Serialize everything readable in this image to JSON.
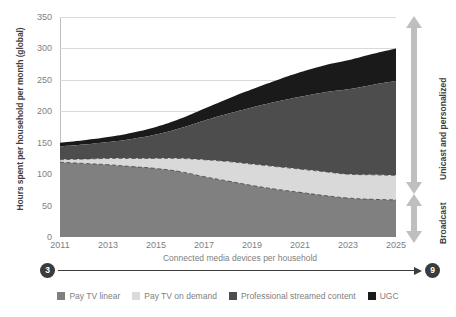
{
  "chart_data": {
    "type": "area",
    "title": "",
    "subtitle": "",
    "xlabel": "",
    "ylabel": "Hours spent per household per month (global)",
    "ylim": [
      0,
      350
    ],
    "ytick_values": [
      0,
      50,
      100,
      150,
      200,
      250,
      300,
      350
    ],
    "ytick_labels": [
      "0",
      "50",
      "100",
      "150",
      "200",
      "250",
      "300",
      "350"
    ],
    "xlim": [
      2011,
      2025
    ],
    "x": [
      2011,
      2012,
      2013,
      2014,
      2015,
      2016,
      2017,
      2018,
      2019,
      2020,
      2021,
      2022,
      2023,
      2024,
      2025
    ],
    "xtick_values": [
      2011,
      2013,
      2015,
      2017,
      2019,
      2021,
      2023,
      2025
    ],
    "xtick_labels": [
      "2011",
      "2013",
      "2015",
      "2017",
      "2019",
      "2021",
      "2023",
      "2025"
    ],
    "grid": true,
    "stacked": true,
    "legend_position": "bottom",
    "series": [
      {
        "name": "Pay TV linear",
        "color": "#808080",
        "values": [
          119,
          117,
          115,
          112,
          109,
          104,
          96,
          89,
          82,
          76,
          71,
          66,
          62,
          60,
          59
        ]
      },
      {
        "name": "Pay TV on demand",
        "color": "#d9d9d9",
        "values": [
          4,
          7,
          10,
          13,
          16,
          21,
          27,
          31,
          34,
          36,
          37,
          38,
          38,
          39,
          39
        ]
      },
      {
        "name": "Professional streamed content",
        "color": "#4d4d4d",
        "values": [
          21,
          23,
          26,
          31,
          38,
          48,
          62,
          76,
          90,
          103,
          115,
          126,
          135,
          143,
          150
        ]
      },
      {
        "name": "UGC",
        "color": "#1a1a1a",
        "values": [
          6,
          7,
          8,
          10,
          12,
          15,
          19,
          24,
          29,
          34,
          39,
          43,
          46,
          49,
          52
        ]
      }
    ],
    "annotations": {
      "right_brackets": [
        {
          "label": "Unicast and personalized",
          "from_value": 98,
          "to_value": 350
        },
        {
          "label": "Broadcast",
          "from_value": 0,
          "to_value": 95
        }
      ],
      "bottom_arrow": {
        "label": "Connected media devices per household",
        "start_value": "3",
        "end_value": "9"
      }
    }
  },
  "colors": {
    "pay_tv_linear": "#808080",
    "pay_tv_on_demand": "#d9d9d9",
    "professional_streamed": "#4d4d4d",
    "ugc": "#1a1a1a",
    "gridline": "#d9d9d9",
    "axis": "#bfbfbf",
    "text": "#808080",
    "bold_text": "#404040",
    "arrow_gray": "#bfbfbf",
    "pill": "#3b3b3b"
  }
}
